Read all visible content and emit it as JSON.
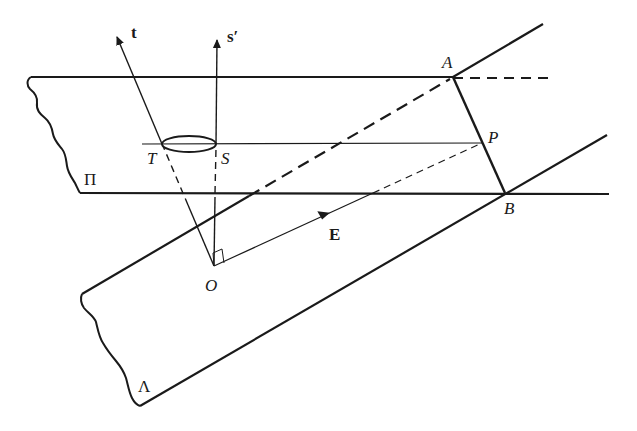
{
  "figure": {
    "planes": {
      "pi": {
        "label": "Π"
      },
      "lambda": {
        "label": "Λ"
      }
    },
    "points": {
      "A": "A",
      "B": "B",
      "P": "P",
      "T": "T",
      "S": "S",
      "O": "O"
    },
    "vectors": {
      "t": "t",
      "s_prime": "s′",
      "E": "E"
    },
    "colors": {
      "ink": "#1a1a1a",
      "background": "#ffffff"
    }
  }
}
